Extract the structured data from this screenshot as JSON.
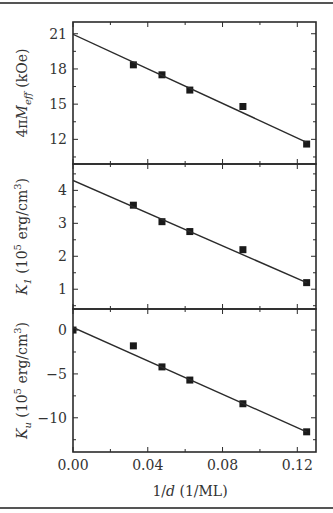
{
  "figure": {
    "xlabel_main": "1/",
    "xlabel_italic": "d",
    "xlabel_unit": " (1/ML)"
  },
  "chart_data": [
    {
      "type": "scatter",
      "title": "",
      "panel": "top",
      "ylabel": "4πM_eff (kOe)",
      "ylabel_parts": {
        "pre": "4π",
        "M": "M",
        "sub": "eff",
        "unit": " (kOe)"
      },
      "xlabel": "1/d (1/ML)",
      "xlim": [
        0.0,
        0.13
      ],
      "ylim": [
        9.9,
        22.0
      ],
      "yticks": [
        12,
        15,
        18,
        21
      ],
      "ytick_labels": [
        "12",
        "15",
        "18",
        "21"
      ],
      "series": [
        {
          "name": "data",
          "marker": "square",
          "x": [
            0.0323,
            0.0476,
            0.0625,
            0.0909,
            0.125
          ],
          "y": [
            18.35,
            17.5,
            16.2,
            14.8,
            11.6
          ]
        },
        {
          "name": "linear fit",
          "style": "line",
          "x": [
            0.0,
            0.125
          ],
          "y": [
            20.95,
            11.75
          ]
        }
      ]
    },
    {
      "type": "scatter",
      "title": "",
      "panel": "middle",
      "ylabel": "K_1 (10^5 erg/cm^3)",
      "ylabel_parts": {
        "K": "K",
        "sub": "1",
        "pre": " (10",
        "sup": "5",
        "unit": " erg/cm",
        "sup2": "3",
        "close": ")"
      },
      "xlabel": "1/d (1/ML)",
      "xlim": [
        0.0,
        0.13
      ],
      "ylim": [
        0.4,
        4.8
      ],
      "yticks": [
        1,
        2,
        3,
        4
      ],
      "ytick_labels": [
        "1",
        "2",
        "3",
        "4"
      ],
      "series": [
        {
          "name": "data",
          "marker": "square",
          "x": [
            0.0323,
            0.0476,
            0.0625,
            0.0909,
            0.125
          ],
          "y": [
            3.55,
            3.05,
            2.75,
            2.2,
            1.2
          ]
        },
        {
          "name": "linear fit",
          "style": "line",
          "x": [
            0.0,
            0.125
          ],
          "y": [
            4.3,
            1.2
          ]
        }
      ]
    },
    {
      "type": "scatter",
      "title": "",
      "panel": "bottom",
      "ylabel": "K_u (10^5 erg/cm^3)",
      "ylabel_parts": {
        "K": "K",
        "sub": "u",
        "pre": " (10",
        "sup": "5",
        "unit": " erg/cm",
        "sup2": "3",
        "close": ")"
      },
      "xlabel": "1/d (1/ML)",
      "xlim": [
        0.0,
        0.13
      ],
      "ylim": [
        -13.9,
        2.4
      ],
      "yticks": [
        -10,
        -5,
        0
      ],
      "ytick_labels": [
        "−10",
        "−5",
        "0"
      ],
      "xticks": [
        0.0,
        0.04,
        0.08,
        0.12
      ],
      "xtick_labels": [
        "0.00",
        "0.04",
        "0.08",
        "0.12"
      ],
      "series": [
        {
          "name": "data",
          "marker": "square",
          "x": [
            0.0,
            0.0323,
            0.0476,
            0.0625,
            0.0909,
            0.125
          ],
          "y": [
            0.0,
            -1.8,
            -4.2,
            -5.7,
            -8.4,
            -11.6
          ]
        },
        {
          "name": "linear fit",
          "style": "line",
          "x": [
            0.0,
            0.125
          ],
          "y": [
            0.3,
            -11.6
          ]
        }
      ]
    }
  ]
}
